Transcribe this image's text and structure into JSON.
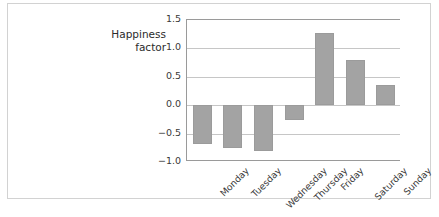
{
  "chart_data": {
    "type": "bar",
    "title": "",
    "subtitle": "",
    "xlabel": "",
    "ylabel": "Happiness factor",
    "ylabel_lines": [
      "Happiness",
      "factor"
    ],
    "categories": [
      "Monday",
      "Tuesday",
      "Wednesday",
      "Thursday",
      "Friday",
      "Saturday",
      "Sunday"
    ],
    "values": [
      -0.68,
      -0.76,
      -0.8,
      -0.26,
      1.27,
      0.79,
      0.35
    ],
    "ylim": [
      -1.0,
      1.5
    ],
    "yticks": [
      1.5,
      1.0,
      0.5,
      0.0,
      -0.5,
      -1.0
    ],
    "ytick_labels": [
      "1.5",
      "1.0",
      "0.5",
      "0.0",
      "−0.5",
      "−1.0"
    ],
    "grid": true,
    "grid_axis": "y",
    "legend": false,
    "legend_position": "none",
    "bar_color": "#a3a3a3",
    "grid_color": "#c6c6c6",
    "axis_color": "#9a9a9a",
    "background_color": "#ffffff",
    "xtick_rotation": -45
  }
}
